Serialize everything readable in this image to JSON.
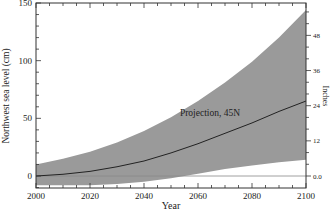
{
  "chart_data": {
    "type": "area",
    "title": "",
    "xlabel": "Year",
    "ylabel": "Northwest sea level (cm)",
    "y2label": "Inches",
    "xlim": [
      2000,
      2100
    ],
    "ylim": [
      -10,
      150
    ],
    "x_ticks": [
      2000,
      2020,
      2040,
      2060,
      2080,
      2100
    ],
    "y_ticks": [
      0,
      50,
      100,
      150
    ],
    "y2_ticks": [
      "0.0",
      "12",
      "24",
      "36",
      "48"
    ],
    "grid": false,
    "annotation": "Projection, 45N",
    "x": [
      2000,
      2010,
      2020,
      2030,
      2040,
      2050,
      2060,
      2070,
      2080,
      2090,
      2100
    ],
    "series": [
      {
        "name": "Projection, 45N",
        "values": [
          0,
          1.5,
          4,
          8,
          13,
          20,
          28,
          37,
          46,
          56,
          65
        ]
      },
      {
        "name": "Upper bound",
        "values": [
          10,
          15,
          21,
          29,
          39,
          51,
          65,
          81,
          99,
          120,
          144
        ]
      },
      {
        "name": "Lower bound",
        "values": [
          -8,
          -8,
          -8,
          -7,
          -5,
          -2,
          2,
          6,
          9,
          12,
          14
        ]
      }
    ],
    "colors": {
      "band": "#9a9a9a",
      "line": "#222222",
      "zero_line": "#888888"
    }
  }
}
